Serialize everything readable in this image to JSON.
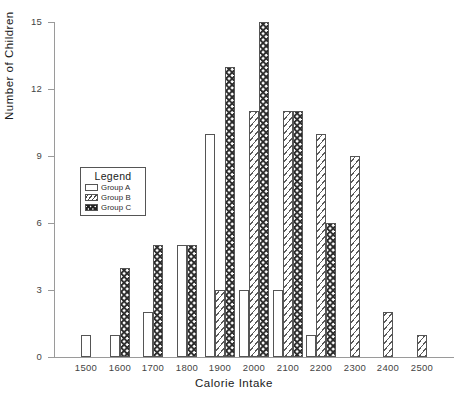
{
  "chart_data": {
    "type": "bar",
    "title": "",
    "xlabel": "Calorie Intake",
    "ylabel": "Number of Children",
    "categories": [
      "1500",
      "1600",
      "1700",
      "1800",
      "1900",
      "2000",
      "2100",
      "2200",
      "2300",
      "2400",
      "2500"
    ],
    "series": [
      {
        "name": "Group A",
        "pattern": "empty",
        "values": [
          1,
          1,
          2,
          5,
          10,
          3,
          3,
          1,
          0,
          0,
          0
        ]
      },
      {
        "name": "Group B",
        "pattern": "hatch",
        "values": [
          0,
          0,
          0,
          0,
          3,
          11,
          11,
          10,
          9,
          2,
          1
        ]
      },
      {
        "name": "Group C",
        "pattern": "checkered",
        "values": [
          0,
          4,
          5,
          5,
          13,
          15,
          11,
          6,
          0,
          0,
          0
        ]
      }
    ],
    "xlim": [
      1440,
      2560
    ],
    "ylim": [
      0,
      15
    ],
    "yticks": [
      0,
      3,
      6,
      9,
      12,
      15
    ],
    "xticks": [
      "1500",
      "1600",
      "1700",
      "1800",
      "1900",
      "2000",
      "2100",
      "2200",
      "2300",
      "2400",
      "2500"
    ],
    "grid": false,
    "legend_position": "inside-left",
    "colors": {
      "axis": "#9a9a9a",
      "bar_outline": "#555555",
      "bar_fill": "#ffffff",
      "pattern_ink": "#2b2b2b",
      "text": "#1a1a1a"
    }
  },
  "legend": {
    "title": "Legend",
    "items": [
      {
        "label": "Group A",
        "pattern": "group-a"
      },
      {
        "label": "Group B",
        "pattern": "group-b"
      },
      {
        "label": "Group C",
        "pattern": "group-c"
      }
    ]
  },
  "axes": {
    "y_title": "Number of Children",
    "x_title": "Calorie Intake",
    "y_tick_labels": [
      "0",
      "3",
      "6",
      "9",
      "12",
      "15"
    ],
    "x_tick_labels": [
      "1500",
      "1600",
      "1700",
      "1800",
      "1900",
      "2000",
      "2100",
      "2200",
      "2300",
      "2400",
      "2500"
    ]
  }
}
